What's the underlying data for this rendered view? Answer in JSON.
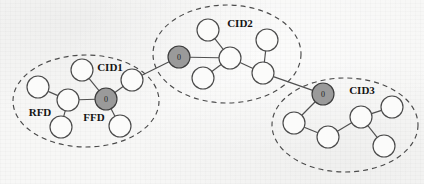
{
  "figure": {
    "width": 424,
    "height": 184,
    "background_color": "#f7f7f6",
    "stroke_color": "#4a4a4a",
    "coordinator_fill": "#9a9a9a",
    "node_fill": "#fbfbfa"
  },
  "clusters": [
    {
      "id": "cid1",
      "label": "CID1",
      "label_x": 110,
      "label_y": 67,
      "ellipse": {
        "cx": 86,
        "cy": 101,
        "rx": 73,
        "ry": 46
      }
    },
    {
      "id": "cid2",
      "label": "CID2",
      "label_x": 240,
      "label_y": 23,
      "ellipse": {
        "cx": 227,
        "cy": 54,
        "rx": 74,
        "ry": 49
      }
    },
    {
      "id": "cid3",
      "label": "CID3",
      "label_x": 362,
      "label_y": 90,
      "ellipse": {
        "cx": 345,
        "cy": 125,
        "rx": 73,
        "ry": 47
      }
    }
  ],
  "device_labels": [
    {
      "id": "rfd-label",
      "text": "RFD",
      "x": 40,
      "y": 112
    },
    {
      "id": "ffd-label",
      "text": "FFD",
      "x": 94,
      "y": 117
    }
  ],
  "nodes": [
    {
      "id": "c1-n1",
      "cluster": "cid1",
      "x": 82,
      "y": 70,
      "r": 11,
      "type": "plain",
      "label": ""
    },
    {
      "id": "c1-n2",
      "cluster": "cid1",
      "x": 38,
      "y": 87,
      "r": 11,
      "type": "plain",
      "label": ""
    },
    {
      "id": "c1-n3",
      "cluster": "cid1",
      "x": 68,
      "y": 100,
      "r": 11,
      "type": "plain",
      "label": ""
    },
    {
      "id": "c1-n4",
      "cluster": "cid1",
      "x": 61,
      "y": 127,
      "r": 11,
      "type": "plain",
      "label": ""
    },
    {
      "id": "c1-c0",
      "cluster": "cid1",
      "x": 106,
      "y": 99,
      "r": 11,
      "type": "coordinator",
      "label": "0"
    },
    {
      "id": "c1-n5",
      "cluster": "cid1",
      "x": 132,
      "y": 80,
      "r": 11,
      "type": "plain",
      "label": ""
    },
    {
      "id": "c1-n6",
      "cluster": "cid1",
      "x": 120,
      "y": 126,
      "r": 11,
      "type": "plain",
      "label": ""
    },
    {
      "id": "c2-c0",
      "cluster": "cid2",
      "x": 179,
      "y": 57,
      "r": 11,
      "type": "coordinator",
      "label": "0"
    },
    {
      "id": "c2-n1",
      "cluster": "cid2",
      "x": 208,
      "y": 30,
      "r": 11,
      "type": "plain",
      "label": ""
    },
    {
      "id": "c2-n2",
      "cluster": "cid2",
      "x": 230,
      "y": 58,
      "r": 11,
      "type": "plain",
      "label": ""
    },
    {
      "id": "c2-n3",
      "cluster": "cid2",
      "x": 203,
      "y": 78,
      "r": 11,
      "type": "plain",
      "label": ""
    },
    {
      "id": "c2-n4",
      "cluster": "cid2",
      "x": 267,
      "y": 40,
      "r": 11,
      "type": "plain",
      "label": ""
    },
    {
      "id": "c2-n5",
      "cluster": "cid2",
      "x": 263,
      "y": 73,
      "r": 11,
      "type": "plain",
      "label": ""
    },
    {
      "id": "c3-c0",
      "cluster": "cid3",
      "x": 323,
      "y": 94,
      "r": 11,
      "type": "coordinator",
      "label": "0"
    },
    {
      "id": "c3-n1",
      "cluster": "cid3",
      "x": 294,
      "y": 123,
      "r": 11,
      "type": "plain",
      "label": ""
    },
    {
      "id": "c3-n2",
      "cluster": "cid3",
      "x": 328,
      "y": 137,
      "r": 11,
      "type": "plain",
      "label": ""
    },
    {
      "id": "c3-n3",
      "cluster": "cid3",
      "x": 361,
      "y": 117,
      "r": 11,
      "type": "plain",
      "label": ""
    },
    {
      "id": "c3-n4",
      "cluster": "cid3",
      "x": 392,
      "y": 107,
      "r": 11,
      "type": "plain",
      "label": ""
    },
    {
      "id": "c3-n5",
      "cluster": "cid3",
      "x": 384,
      "y": 146,
      "r": 11,
      "type": "plain",
      "label": ""
    }
  ],
  "edges": [
    {
      "from": "c1-n2",
      "to": "c1-n3",
      "kind": "intra"
    },
    {
      "from": "c1-n3",
      "to": "c1-n4",
      "kind": "intra"
    },
    {
      "from": "c1-n3",
      "to": "c1-c0",
      "kind": "intra"
    },
    {
      "from": "c1-n1",
      "to": "c1-c0",
      "kind": "intra"
    },
    {
      "from": "c1-c0",
      "to": "c1-n5",
      "kind": "intra"
    },
    {
      "from": "c1-c0",
      "to": "c1-n6",
      "kind": "intra"
    },
    {
      "from": "c2-c0",
      "to": "c2-n2",
      "kind": "intra"
    },
    {
      "from": "c2-n1",
      "to": "c2-n2",
      "kind": "intra"
    },
    {
      "from": "c2-n3",
      "to": "c2-n2",
      "kind": "intra"
    },
    {
      "from": "c2-n2",
      "to": "c2-n5",
      "kind": "intra"
    },
    {
      "from": "c2-n4",
      "to": "c2-n5",
      "kind": "intra"
    },
    {
      "from": "c3-c0",
      "to": "c3-n1",
      "kind": "intra"
    },
    {
      "from": "c3-n1",
      "to": "c3-n2",
      "kind": "intra"
    },
    {
      "from": "c3-n2",
      "to": "c3-n3",
      "kind": "intra"
    },
    {
      "from": "c3-n3",
      "to": "c3-n4",
      "kind": "intra"
    },
    {
      "from": "c3-n3",
      "to": "c3-n5",
      "kind": "intra"
    },
    {
      "from": "c1-n5",
      "to": "c2-c0",
      "kind": "inter"
    },
    {
      "from": "c2-n5",
      "to": "c3-c0",
      "kind": "inter"
    }
  ]
}
